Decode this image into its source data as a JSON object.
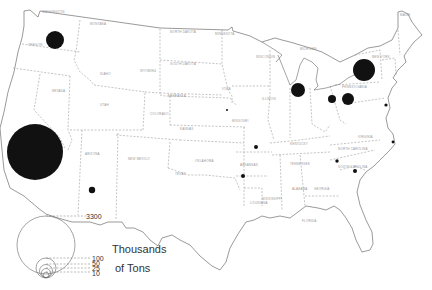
{
  "map": {
    "title": "",
    "subject": "Map of the United States with proportional circles",
    "legend": {
      "unit_line1": "Thousands",
      "unit_line2": "of Tons",
      "values": [
        "3300",
        "100",
        "50",
        "25",
        "10"
      ]
    },
    "symbols": [
      {
        "id": "california",
        "r": 28,
        "cx": 35,
        "cy": 152
      },
      {
        "id": "washington",
        "r": 9,
        "cx": 55,
        "cy": 40
      },
      {
        "id": "new-york",
        "r": 11,
        "cx": 364,
        "cy": 70
      },
      {
        "id": "illinois-indiana",
        "r": 7,
        "cx": 298,
        "cy": 90
      },
      {
        "id": "pennsylvania",
        "r": 6,
        "cx": 348,
        "cy": 99
      },
      {
        "id": "ohio",
        "r": 4,
        "cx": 332,
        "cy": 99
      },
      {
        "id": "arizona",
        "r": 3.2,
        "cx": 92,
        "cy": 190
      },
      {
        "id": "missouri",
        "r": 2,
        "cx": 256,
        "cy": 147
      },
      {
        "id": "arkansas",
        "r": 2,
        "cx": 243,
        "cy": 176
      },
      {
        "id": "virginia",
        "r": 1.7,
        "cx": 337,
        "cy": 161
      },
      {
        "id": "south-carolina",
        "r": 2,
        "cx": 355,
        "cy": 171
      },
      {
        "id": "new-jersey",
        "r": 1.6,
        "cx": 386,
        "cy": 105
      },
      {
        "id": "north-carolina-coast",
        "r": 1.4,
        "cx": 393,
        "cy": 142
      },
      {
        "id": "iowa",
        "r": 1,
        "cx": 227,
        "cy": 110
      }
    ],
    "state_labels": [
      {
        "t": "WASHINGTON",
        "x": 42,
        "y": 13
      },
      {
        "t": "OREGON",
        "x": 28,
        "y": 46
      },
      {
        "t": "MONTANA",
        "x": 90,
        "y": 25
      },
      {
        "t": "IDAHO",
        "x": 100,
        "y": 75
      },
      {
        "t": "WYOMING",
        "x": 140,
        "y": 72
      },
      {
        "t": "NEVADA",
        "x": 52,
        "y": 92
      },
      {
        "t": "UTAH",
        "x": 100,
        "y": 106
      },
      {
        "t": "COLORADO",
        "x": 150,
        "y": 115
      },
      {
        "t": "ARIZONA",
        "x": 85,
        "y": 155
      },
      {
        "t": "NEW MEXICO",
        "x": 128,
        "y": 160
      },
      {
        "t": "NORTH DAKOTA",
        "x": 170,
        "y": 33
      },
      {
        "t": "SOUTH DAKOTA",
        "x": 170,
        "y": 65
      },
      {
        "t": "NEBRASKA",
        "x": 168,
        "y": 97
      },
      {
        "t": "KANSAS",
        "x": 180,
        "y": 130
      },
      {
        "t": "OKLAHOMA",
        "x": 195,
        "y": 162
      },
      {
        "t": "TEXAS",
        "x": 175,
        "y": 175
      },
      {
        "t": "MINNESOTA",
        "x": 215,
        "y": 35
      },
      {
        "t": "IOWA",
        "x": 222,
        "y": 90
      },
      {
        "t": "MISSOURI",
        "x": 232,
        "y": 122
      },
      {
        "t": "ARKANSAS",
        "x": 240,
        "y": 166
      },
      {
        "t": "LOUISIANA",
        "x": 250,
        "y": 204
      },
      {
        "t": "WISCONSIN",
        "x": 256,
        "y": 58
      },
      {
        "t": "MICHIGAN",
        "x": 300,
        "y": 50
      },
      {
        "t": "ILLINOIS",
        "x": 262,
        "y": 100
      },
      {
        "t": "KENTUCKY",
        "x": 290,
        "y": 145
      },
      {
        "t": "TENNESSEE",
        "x": 290,
        "y": 165
      },
      {
        "t": "MISSISSIPPI",
        "x": 262,
        "y": 200
      },
      {
        "t": "ALABAMA",
        "x": 292,
        "y": 190
      },
      {
        "t": "GEORGIA",
        "x": 314,
        "y": 190
      },
      {
        "t": "FLORIDA",
        "x": 302,
        "y": 222
      },
      {
        "t": "SOUTH CAROLINA",
        "x": 338,
        "y": 168
      },
      {
        "t": "NORTH CAROLINA",
        "x": 338,
        "y": 150
      },
      {
        "t": "VIRGINIA",
        "x": 358,
        "y": 138
      },
      {
        "t": "PENNSYLVANIA",
        "x": 342,
        "y": 88
      },
      {
        "t": "NEW YORK",
        "x": 372,
        "y": 58
      },
      {
        "t": "MAINE",
        "x": 400,
        "y": 16
      }
    ]
  }
}
